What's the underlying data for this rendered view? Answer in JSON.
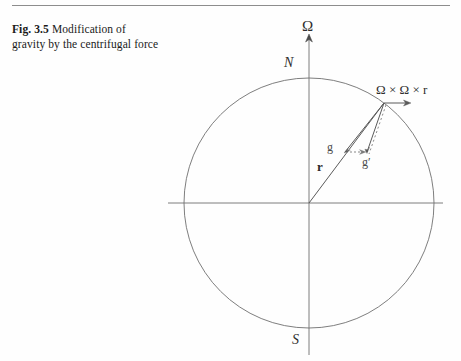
{
  "caption": {
    "figure_number": "Fig. 3.5",
    "text": "Modification of gravity by the centrifugal force"
  },
  "figure": {
    "labels": {
      "rotation_axis": "Ω",
      "north_pole": "N",
      "south_pole": "S",
      "radius_vector": "r",
      "gravity": "g",
      "effective_gravity": "g′",
      "centrifugal_term": "Ω × Ω × r"
    },
    "colors": {
      "rule": "#8d8d8d",
      "circle": "#6f6f6f",
      "axis": "#6f6f6f",
      "vector": "#5a5a5a",
      "dotted": "#8a8a8a",
      "text": "#2e2e2e"
    },
    "geometry": {
      "center_x": 309,
      "center_y": 203,
      "radius": 125,
      "axis_top_y": 36,
      "axis_bottom_y": 355,
      "h_axis_left_x": 168,
      "h_axis_right_x": 443,
      "point_on_sphere_x": 384,
      "point_on_sphere_y": 103,
      "centrifugal_arrow_end_x": 410,
      "g_tip_x": 345,
      "g_tip_y": 152,
      "gprime_tip_x": 367,
      "gprime_tip_y": 152
    }
  }
}
